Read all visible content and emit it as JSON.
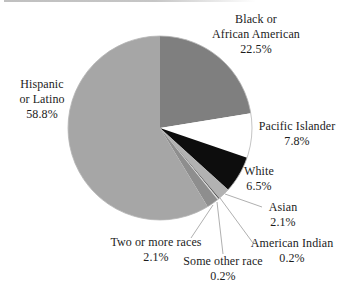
{
  "chart_data": {
    "type": "pie",
    "title": "",
    "direction": "clockwise",
    "start_angle_deg": 0,
    "outline_color": "#b5b5b5",
    "leader_line_color": "#b0b0b0",
    "slices": [
      {
        "key": "black_aa",
        "label": "Black or African American",
        "value": 22.5,
        "color": "#7f7f7f"
      },
      {
        "key": "pacific",
        "label": "Pacific Islander",
        "value": 7.8,
        "color": "#ffffff"
      },
      {
        "key": "white",
        "label": "White",
        "value": 6.5,
        "color": "#0d0d0d"
      },
      {
        "key": "asian",
        "label": "Asian",
        "value": 2.1,
        "color": "#b2b2b2"
      },
      {
        "key": "american_indian",
        "label": "American Indian",
        "value": 0.2,
        "color": "#4d4d4d"
      },
      {
        "key": "some_other",
        "label": "Some other race",
        "value": 0.2,
        "color": "#dcdcdc"
      },
      {
        "key": "two_or_more",
        "label": "Two or more races",
        "value": 2.1,
        "color": "#8e8e8e"
      },
      {
        "key": "hispanic",
        "label": "Hispanic or Latino",
        "value": 58.8,
        "color": "#a6a6a6"
      }
    ]
  },
  "labels": {
    "black_aa": {
      "lines": [
        "Black or",
        "African American",
        "22.5%"
      ]
    },
    "hispanic": {
      "lines": [
        "Hispanic",
        "or Latino",
        "58.8%"
      ]
    },
    "pacific": {
      "lines": [
        "Pacific Islander",
        "7.8%"
      ]
    },
    "white": {
      "lines": [
        "White",
        "6.5%"
      ]
    },
    "asian": {
      "lines": [
        "Asian",
        "2.1%"
      ]
    },
    "american_indian": {
      "lines": [
        "American Indian",
        "0.2%"
      ]
    },
    "two_or_more": {
      "lines": [
        "Two or more races",
        "2.1%"
      ]
    },
    "some_other": {
      "lines": [
        "Some other race",
        "0.2%"
      ]
    }
  }
}
